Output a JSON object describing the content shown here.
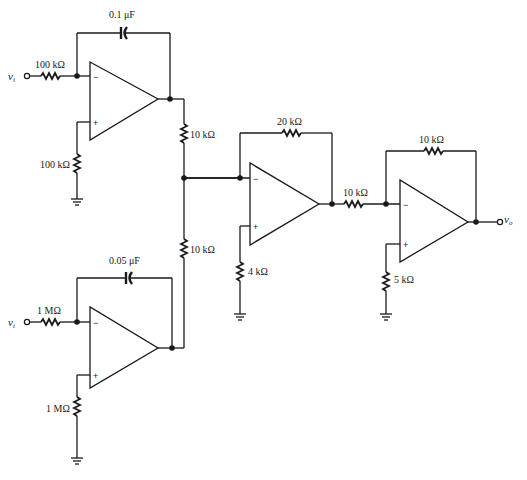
{
  "diagram": {
    "type": "op-amp circuit schematic",
    "stages": [
      {
        "id": "integrator-1",
        "input_label": "v",
        "input_sub": "i",
        "input_resistor": "100 kΩ",
        "feedback_capacitor": "0.1 μF",
        "noninv_resistor": "100 kΩ",
        "output_resistor": "10 kΩ",
        "inv_sign": "−",
        "noninv_sign": "+"
      },
      {
        "id": "integrator-2",
        "input_label": "v",
        "input_sub": "i",
        "input_resistor": "1 MΩ",
        "feedback_capacitor": "0.05 μF",
        "noninv_resistor": "1 MΩ",
        "output_resistor": "10 kΩ",
        "inv_sign": "−",
        "noninv_sign": "+"
      },
      {
        "id": "summing-amp",
        "feedback_resistor": "20 kΩ",
        "noninv_resistor": "4 kΩ",
        "output_resistor": "10 kΩ",
        "inv_sign": "−",
        "noninv_sign": "+"
      },
      {
        "id": "inverting-amp",
        "feedback_resistor": "10 kΩ",
        "noninv_resistor": "5 kΩ",
        "output_label": "v",
        "output_sub": "o",
        "inv_sign": "−",
        "noninv_sign": "+"
      }
    ]
  }
}
